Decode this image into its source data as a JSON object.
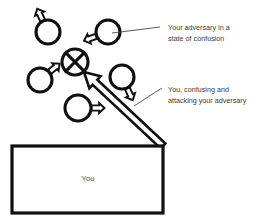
{
  "diagram": {
    "title_visible": false,
    "background_color": "#ffffff",
    "stroke_color": "#0f0f0f",
    "text_color": "#3b3b3b",
    "annotations": [
      {
        "id": "adversary-confusion",
        "line1": "Your adversary in a",
        "line2": "state of confusion",
        "text_x": 168,
        "line1_y": 30,
        "line2_y": 41,
        "leader": {
          "x1": 160,
          "y1": 27,
          "x2": 112,
          "y2": 33
        }
      },
      {
        "id": "you-attacking",
        "line1": "You, confusing and",
        "line2": "attacking your adversary",
        "text_x": 168,
        "line1_y": 92,
        "line2_y": 103,
        "leader": {
          "x1": 162,
          "y1": 88,
          "x2": 134,
          "y2": 106
        }
      }
    ],
    "box": {
      "label": "You",
      "x": 12,
      "y": 146,
      "width": 151,
      "height": 67,
      "label_x": 88,
      "label_y": 181
    },
    "crossed_circle": {
      "id": "adversary-confused-marker",
      "cx": 75,
      "cy": 62,
      "r": 13
    },
    "circles": [
      {
        "id": "unit-top-left",
        "cx": 48,
        "cy": 32,
        "r": 12,
        "arrow_angle_deg": 115
      },
      {
        "id": "unit-top-right",
        "cx": 108,
        "cy": 32,
        "r": 12,
        "arrow_angle_deg": 200
      },
      {
        "id": "unit-mid-left",
        "cx": 40,
        "cy": 80,
        "r": 12,
        "arrow_angle_deg": 40
      },
      {
        "id": "unit-mid-right",
        "cx": 122,
        "cy": 77,
        "r": 12,
        "arrow_angle_deg": -65
      },
      {
        "id": "unit-bottom-mid",
        "cx": 78,
        "cy": 108,
        "r": 13,
        "arrow_angle_deg": 0
      }
    ],
    "attack_arrow": {
      "id": "attack-arrow",
      "from_x": 163,
      "from_y": 146,
      "to_x": 84,
      "to_y": 72
    }
  }
}
